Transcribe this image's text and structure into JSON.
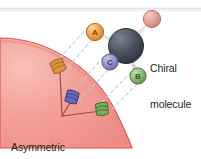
{
  "figure": {
    "title_alt": "Chiral molecule binding to asymmetric binding site",
    "labels": {
      "chiral_line1": "Chiral",
      "chiral_line2": "molecule",
      "binding_line1": "Asymmetric",
      "binding_line2": "binding site"
    },
    "colors": {
      "surface_fill": "#f0908a",
      "surface_fill_light": "#f6b2ac",
      "surface_edge": "#d9534f",
      "atom_a": "#f0a04b",
      "atom_a_edge": "#c06a17",
      "atom_b": "#7fae6a",
      "atom_b_edge": "#4e7a3c",
      "atom_c": "#8e8bc4",
      "atom_c_edge": "#5c5a96",
      "atom_d": "#e09a93",
      "atom_d_edge": "#b56a63",
      "atom_center": "#4a505c",
      "atom_center_edge": "#2b3038",
      "bond": "#d8d8d8",
      "dash": "#bcd0e0",
      "top_rule": "#c9c9c9",
      "text": "#231f20"
    },
    "atoms": [
      {
        "id": "atom-a",
        "label": "A",
        "cx": 95,
        "cy": 32,
        "r": 8.5,
        "fill": "#f0a04b"
      },
      {
        "id": "atom-b",
        "label": "B",
        "cx": 138,
        "cy": 76,
        "r": 8.0,
        "fill": "#7fae6a"
      },
      {
        "id": "atom-c",
        "label": "C",
        "cx": 110,
        "cy": 62,
        "r": 8.0,
        "fill": "#8e8bc4"
      },
      {
        "id": "atom-d",
        "label": "",
        "cx": 152,
        "cy": 19,
        "r": 8.5,
        "fill": "#e09a93"
      },
      {
        "id": "atom-center",
        "label": "",
        "cx": 126,
        "cy": 46,
        "r": 17.5,
        "fill": "#4a505c"
      }
    ],
    "pockets": [
      {
        "id": "pocket-orange",
        "x": 58,
        "y": 66,
        "fill": "#e0903f",
        "edge": "#a9621c",
        "rot": -22
      },
      {
        "id": "pocket-purple",
        "x": 70,
        "y": 97,
        "fill": "#6a67b8",
        "edge": "#3f3d82",
        "rot": 18
      },
      {
        "id": "pocket-green",
        "x": 100,
        "y": 108,
        "fill": "#7cae63",
        "edge": "#456b33",
        "rot": -8
      }
    ],
    "vertex": {
      "x": 62,
      "y": 116
    }
  }
}
